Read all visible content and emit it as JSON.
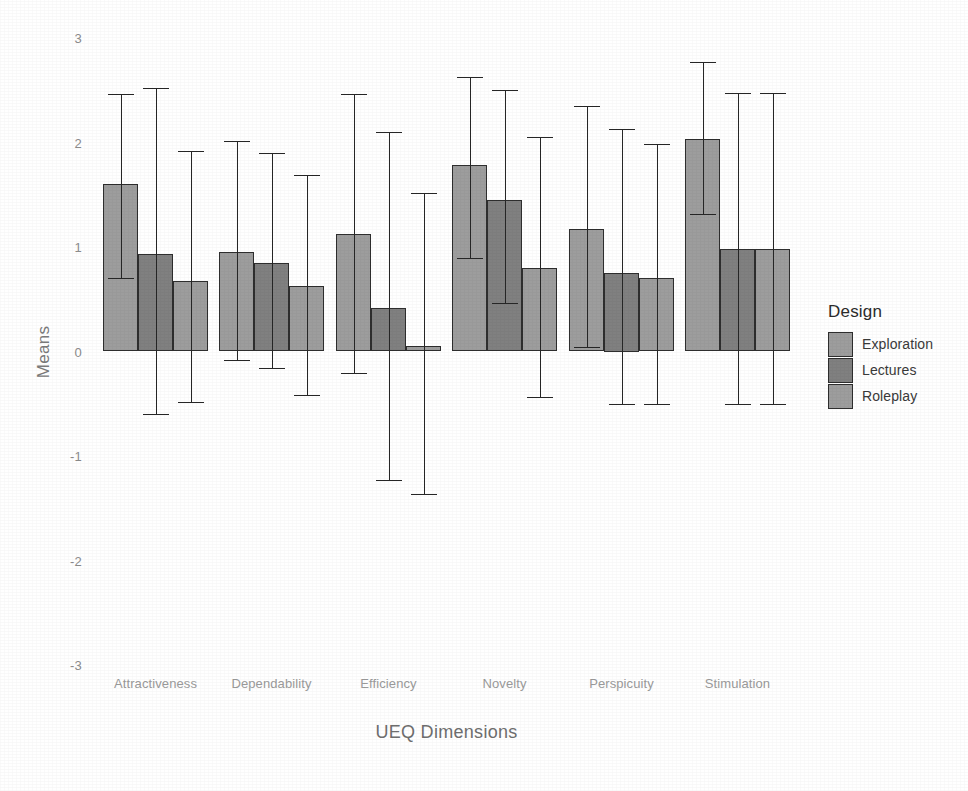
{
  "chart_data": {
    "type": "bar",
    "title": "",
    "xlabel": "UEQ Dimensions",
    "ylabel": "Means",
    "ylim": [
      -3,
      3
    ],
    "yticks": [
      "3",
      "2",
      "1",
      "0",
      "-1",
      "-2",
      "-3"
    ],
    "ytick_values": [
      3,
      2,
      1,
      0,
      -1,
      -2,
      -3
    ],
    "grid": false,
    "legend_position": "right",
    "legend_title": "Design",
    "error_bars": "whiskers with caps (standard deviation)",
    "categories": [
      "Attractiveness",
      "Dependability",
      "Efficiency",
      "Novelty",
      "Perspicuity",
      "Stimulation"
    ],
    "series": [
      {
        "name": "Exploration",
        "color": "#9d9d9d",
        "values": [
          1.6,
          0.95,
          1.12,
          1.78,
          1.17,
          2.03
        ],
        "err_low": [
          0.7,
          -0.08,
          -0.21,
          0.89,
          0.04,
          1.32
        ],
        "err_high": [
          2.46,
          2.01,
          2.46,
          2.63,
          2.35,
          2.77
        ]
      },
      {
        "name": "Lectures",
        "color": "#808080",
        "values": [
          0.93,
          0.85,
          0.42,
          1.45,
          0.75,
          0.98
        ],
        "err_low": [
          -0.6,
          -0.16,
          -1.23,
          0.46,
          -0.5,
          -0.5
        ],
        "err_high": [
          2.52,
          1.9,
          2.1,
          2.5,
          2.13,
          2.47
        ]
      },
      {
        "name": "Roleplay",
        "color": "#9d9d9d",
        "values": [
          0.67,
          0.63,
          0.05,
          0.8,
          0.7,
          0.98
        ],
        "err_low": [
          -0.48,
          -0.42,
          -1.36,
          -0.44,
          -0.5,
          -0.5
        ],
        "err_high": [
          1.92,
          1.69,
          1.52,
          2.05,
          1.99,
          2.47
        ]
      }
    ]
  },
  "legend": {
    "title": "Design",
    "items": [
      {
        "label": "Exploration",
        "color": "#9d9d9d"
      },
      {
        "label": "Lectures",
        "color": "#808080"
      },
      {
        "label": "Roleplay",
        "color": "#9d9d9d"
      }
    ]
  },
  "axes": {
    "x_title": "UEQ Dimensions",
    "y_title": "Means"
  }
}
